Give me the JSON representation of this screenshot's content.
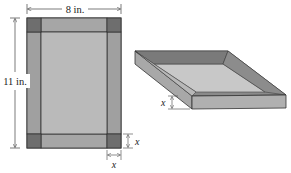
{
  "figure": {
    "flat_sheet": {
      "width_label": "8 in.",
      "height_label": "11 in.",
      "corner_cut_label_vertical": "x",
      "corner_cut_label_horizontal": "x"
    },
    "open_box": {
      "height_label": "x"
    },
    "colors": {
      "sheet_fill": "#b4b4b4",
      "flap_fill": "#a4a4a4",
      "corner_fill": "#6e6e6e",
      "box_top_rim": "#8a8a8a",
      "box_inner_floor": "#c8c8c8",
      "box_front_side": "#b0b0b0",
      "box_right_side": "#9a9a9a",
      "outline": "#333333"
    }
  }
}
